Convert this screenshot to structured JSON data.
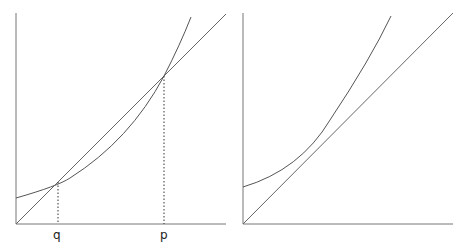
{
  "left_panel": {
    "labels": {
      "q": "q",
      "p": "p"
    },
    "description": "Convex curve intersecting straight line through origin at two points q and p"
  },
  "right_panel": {
    "description": "Convex curve lying entirely above straight line through origin"
  },
  "colors": {
    "curve": "#555555",
    "axis": "#777777",
    "guide": "#333333"
  }
}
